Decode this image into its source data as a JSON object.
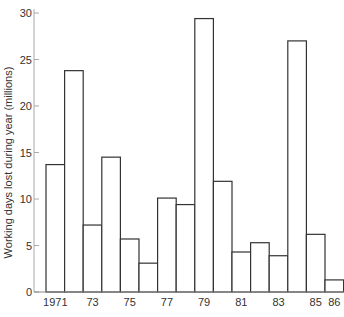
{
  "chart_data": {
    "type": "bar",
    "title": "",
    "xlabel": "",
    "ylabel": "Working days lost during year (millions)",
    "ylim": [
      0,
      30
    ],
    "yticks": [
      0,
      5,
      10,
      15,
      20,
      25,
      30
    ],
    "ytick_labels": [
      "0",
      "5",
      "10",
      "15",
      "20",
      "25",
      "30"
    ],
    "categories": [
      "1971",
      "1972",
      "1973",
      "1974",
      "1975",
      "1976",
      "1977",
      "1978",
      "1979",
      "1980",
      "1981",
      "1982",
      "1983",
      "1984",
      "1985",
      "1986"
    ],
    "values": [
      13.7,
      23.8,
      7.2,
      14.5,
      5.7,
      3.1,
      10.1,
      9.4,
      29.4,
      11.9,
      4.3,
      5.3,
      3.9,
      27.0,
      6.2,
      1.3
    ],
    "xtick_labels": [
      {
        "category": "1971",
        "label": "1971"
      },
      {
        "category": "1973",
        "label": "73"
      },
      {
        "category": "1975",
        "label": "75"
      },
      {
        "category": "1977",
        "label": "77"
      },
      {
        "category": "1979",
        "label": "79"
      },
      {
        "category": "1981",
        "label": "81"
      },
      {
        "category": "1983",
        "label": "83"
      },
      {
        "category": "1985",
        "label": "85"
      },
      {
        "category": "1986",
        "label": "86"
      }
    ],
    "grid": false,
    "legend": "none",
    "bar_style": {
      "fill": "#ffffff",
      "stroke": "#333333"
    }
  }
}
